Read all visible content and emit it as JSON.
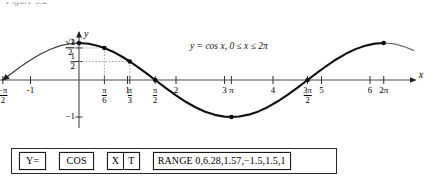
{
  "caption_fragment": "Figure 5.2",
  "equation_label": "y = cos x, 0 ≤ x ≤ 2π",
  "axes": {
    "x_axis_name": "x",
    "y_axis_name": "y"
  },
  "chart_data": {
    "type": "line",
    "title": "",
    "subtitle": "",
    "annotation": "y = cos x, 0 ≤ x ≤ 2π",
    "function": "y = cos x",
    "domain_text": "0 ≤ x ≤ 2π",
    "xlabel": "x",
    "ylabel": "y",
    "xlim": [
      -1.5708,
      6.9
    ],
    "ylim": [
      -1.35,
      1.35
    ],
    "grid": false,
    "legend": null,
    "x_ticks": [
      {
        "value": -1.5708,
        "label": "-π/2",
        "numerator": "−π",
        "denominator": "2"
      },
      {
        "value": -1,
        "label": "-1"
      },
      {
        "value": 0.5236,
        "label": "π/6",
        "numerator": "π",
        "denominator": "6"
      },
      {
        "value": 1,
        "label": "1"
      },
      {
        "value": 1.0472,
        "label": "π/3",
        "numerator": "π",
        "denominator": "3"
      },
      {
        "value": 1.5708,
        "label": "π/2",
        "numerator": "π",
        "denominator": "2"
      },
      {
        "value": 2,
        "label": "2"
      },
      {
        "value": 3,
        "label": "3"
      },
      {
        "value": 3.1416,
        "label": "π"
      },
      {
        "value": 4,
        "label": "4"
      },
      {
        "value": 4.7124,
        "label": "3π/2",
        "numerator": "3π",
        "denominator": "2"
      },
      {
        "value": 5,
        "label": "5"
      },
      {
        "value": 6,
        "label": "6"
      },
      {
        "value": 6.2832,
        "label": "2π"
      }
    ],
    "y_ticks": [
      {
        "value": 1,
        "label": "1"
      },
      {
        "value": 0.866,
        "label": "√3/2",
        "numerator": "√3",
        "denominator": "2"
      },
      {
        "value": 0.5,
        "label": "1/2",
        "numerator": "1",
        "denominator": "2"
      },
      {
        "value": -1,
        "label": "−1"
      }
    ],
    "marked_points": [
      {
        "x": 0,
        "y": 1,
        "label": "(0, 1)"
      },
      {
        "x": 0.5236,
        "y": 0.866,
        "label": "(π/6, √3/2)"
      },
      {
        "x": 1.0472,
        "y": 0.5,
        "label": "(π/3, 1/2)"
      },
      {
        "x": 1.5708,
        "y": 0,
        "label": "(π/2, 0)"
      },
      {
        "x": 3.1416,
        "y": -1,
        "label": "(π, −1)"
      },
      {
        "x": 4.7124,
        "y": 0,
        "label": "(3π/2, 0)"
      },
      {
        "x": 6.2832,
        "y": 1,
        "label": "(2π, 1)"
      }
    ],
    "series": [
      {
        "name": "y = cos x",
        "emphasis_range": [
          0,
          6.2832
        ],
        "x": [
          -1.5708,
          -1.4,
          -1.2,
          -1.0,
          -0.8,
          -0.6,
          -0.4,
          -0.2,
          0.0,
          0.2,
          0.4,
          0.5236,
          0.7,
          0.9,
          1.0472,
          1.2,
          1.4,
          1.5708,
          1.8,
          2.0,
          2.2,
          2.4,
          2.6,
          2.8,
          3.0,
          3.1416,
          3.3,
          3.5,
          3.7,
          3.9,
          4.1,
          4.3,
          4.5,
          4.7124,
          4.9,
          5.1,
          5.3,
          5.5,
          5.7,
          5.9,
          6.1,
          6.2832,
          6.5,
          6.7,
          6.9
        ],
        "y": [
          0.0,
          0.17,
          0.3624,
          0.5403,
          0.6967,
          0.8253,
          0.9211,
          0.9801,
          1.0,
          0.9801,
          0.9211,
          0.866,
          0.7648,
          0.6216,
          0.5,
          0.3624,
          0.17,
          0.0,
          -0.2272,
          -0.4161,
          -0.5885,
          -0.7374,
          -0.8569,
          -0.9422,
          -0.99,
          -1.0,
          -0.9875,
          -0.9365,
          -0.8486,
          -0.7281,
          -0.5748,
          -0.4008,
          -0.2108,
          0.0,
          0.1865,
          0.378,
          0.5544,
          0.7087,
          0.8347,
          0.9275,
          0.9833,
          1.0,
          0.9766,
          0.9041,
          0.8021
        ]
      }
    ]
  },
  "keybar": {
    "keys": [
      {
        "id": "y-equals",
        "label": "Y="
      },
      {
        "id": "cos",
        "label": "COS"
      },
      {
        "id": "x-t",
        "label": "X|T",
        "left": "X",
        "right": "T"
      },
      {
        "id": "range",
        "label": "RANGE 0,6.28,1.57,−1.5,1.5,1"
      }
    ]
  }
}
